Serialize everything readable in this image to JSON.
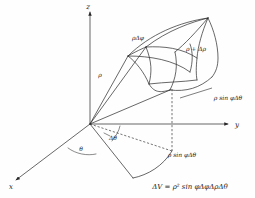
{
  "figure": {
    "background_color": "#fefefe",
    "line_color": "#262626",
    "text_color": "#1a1a1a"
  },
  "axes": {
    "x_label": "x",
    "y_label": "y",
    "z_label": "z"
  },
  "annotations": {
    "rho": "ρ",
    "rho_delta_phi": "ρΔφ",
    "rho_plus_delta_rho": "ρ + Δρ",
    "rho_sin_phi_delta_theta_upper": "ρ sin φΔθ",
    "rho_sin_phi_delta_theta_lower": "ρ sin φΔθ",
    "theta": "θ",
    "delta_theta": "Δθ"
  },
  "formula": {
    "text": "ΔV = ρ² sin φΔφΔρΔθ",
    "lhs": "ΔV",
    "equals": "=",
    "rhs": "ρ² sin φΔφΔρΔθ"
  }
}
